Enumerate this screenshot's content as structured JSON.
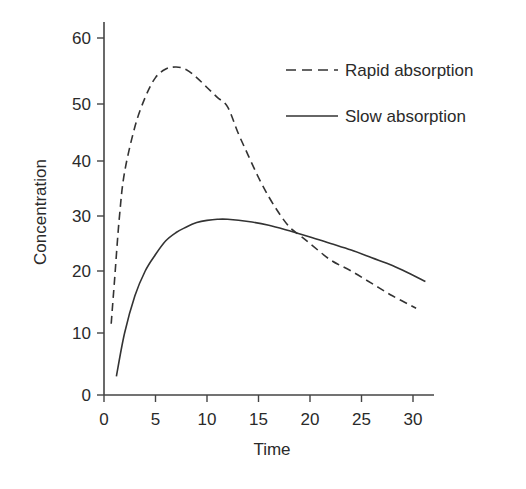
{
  "chart_data": {
    "type": "line",
    "title": "",
    "xlabel": "Time",
    "ylabel": "Concentration",
    "xlim": [
      0,
      32
    ],
    "ylim": [
      0,
      63
    ],
    "grid": false,
    "legend_position": "upper right",
    "x_ticks": [
      0,
      5,
      10,
      15,
      20,
      25,
      30
    ],
    "y_ticks": [
      0,
      10,
      20,
      30,
      40,
      50,
      60
    ],
    "series": [
      {
        "name": "Rapid absorption",
        "style": "dashed",
        "color": "#333333",
        "x": [
          0.7,
          1,
          1.5,
          2,
          3,
          4,
          5,
          6,
          7,
          8,
          9,
          10,
          11,
          12,
          13,
          14,
          15,
          16,
          17,
          18,
          19,
          20,
          22,
          24,
          26,
          28,
          30.3
        ],
        "values": [
          11.5,
          18,
          30,
          38,
          46,
          51,
          54,
          55.3,
          55.6,
          55.2,
          54,
          52.5,
          51,
          49.5,
          45,
          41,
          37,
          33.5,
          30.5,
          28,
          26.5,
          25,
          22,
          20,
          18,
          16,
          14
        ]
      },
      {
        "name": "Slow absorption",
        "style": "solid",
        "color": "#333333",
        "x": [
          1.2,
          2,
          3,
          4,
          5,
          6,
          7,
          8,
          9,
          10,
          11,
          12,
          14,
          16,
          18,
          20,
          22,
          24,
          26,
          28,
          30,
          31.2
        ],
        "values": [
          3,
          10,
          16,
          20,
          23,
          25.5,
          27,
          28,
          28.8,
          29.2,
          29.4,
          29.4,
          29,
          28.3,
          27.3,
          26.2,
          25,
          23.8,
          22.4,
          21,
          19.3,
          18.3
        ]
      }
    ]
  },
  "legend": {
    "items": [
      {
        "label": "Rapid absorption",
        "style": "dashed"
      },
      {
        "label": "Slow absorption",
        "style": "solid"
      }
    ]
  },
  "axes": {
    "x_title": "Time",
    "y_title": "Concentration"
  }
}
